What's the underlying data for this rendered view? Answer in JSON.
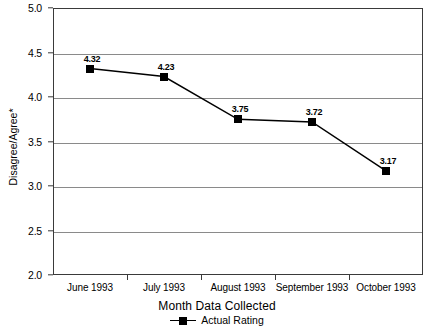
{
  "chart_data": {
    "type": "line",
    "title": "",
    "xlabel": "Month Data Collected",
    "ylabel": "Disagree/Agree*",
    "categories": [
      "June 1993",
      "July 1993",
      "August 1993",
      "September 1993",
      "October 1993"
    ],
    "values": [
      4.32,
      4.23,
      3.75,
      3.72,
      3.17
    ],
    "point_labels": [
      "4.32",
      "4.23",
      "3.75",
      "3.72",
      "3.17"
    ],
    "series": [
      {
        "name": "Actual Rating",
        "values": [
          4.32,
          4.23,
          3.75,
          3.72,
          3.17
        ],
        "marker": "square",
        "color": "#000000"
      }
    ],
    "ylim": [
      2.0,
      5.0
    ],
    "ytick_step": 0.5,
    "ytick_labels": [
      "5.0",
      "4.5",
      "4.0",
      "3.5",
      "3.0",
      "2.5",
      "2.0"
    ],
    "ytick_values": [
      5.0,
      4.5,
      4.0,
      3.5,
      3.0,
      2.5,
      2.0
    ],
    "grid": true,
    "grid_axis": "y",
    "legend_position": "bottom-center",
    "legend_entries": [
      "Actual Rating"
    ],
    "colors": {
      "line": "#000000",
      "marker": "#000000",
      "grid": "#8a8a8a",
      "frame": "#3a3a3a",
      "background": "#ffffff"
    }
  },
  "legend": {
    "label": "Actual Rating"
  }
}
